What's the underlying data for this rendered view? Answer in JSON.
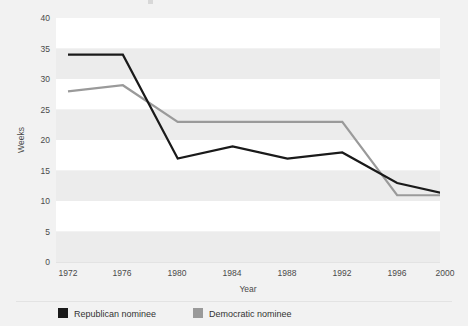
{
  "chart_data": {
    "type": "line",
    "title": "",
    "xlabel": "Year",
    "ylabel": "Weeks",
    "categories": [
      "1972",
      "1976",
      "1980",
      "1984",
      "1988",
      "1992",
      "1996",
      "2000"
    ],
    "x": [
      1972,
      1976,
      1980,
      1984,
      1988,
      1992,
      1996,
      2000
    ],
    "xlim": [
      1972,
      2000
    ],
    "ylim": [
      0,
      40
    ],
    "yticks": [
      "0",
      "5",
      "10",
      "15",
      "20",
      "25",
      "30",
      "35",
      "40"
    ],
    "ytick_values": [
      0,
      5,
      10,
      15,
      20,
      25,
      30,
      35,
      40
    ],
    "grid": "horizontal-banding",
    "legend_position": "bottom",
    "series": [
      {
        "name": "Republican nominee",
        "color": "#1a1a1a",
        "values": [
          34,
          34,
          17,
          19,
          17,
          18,
          13,
          11
        ]
      },
      {
        "name": "Democratic nominee",
        "color": "#9a9a9a",
        "values": [
          28,
          29,
          23,
          23,
          23,
          23,
          11,
          11
        ]
      }
    ]
  },
  "legend": {
    "items": [
      {
        "label": "Republican nominee",
        "swatch": "#1a1a1a"
      },
      {
        "label": "Democratic nominee",
        "swatch": "#9a9a9a"
      }
    ]
  },
  "colors": {
    "page_background": "#f2f2f2",
    "band_light": "#ffffff",
    "band_shade": "#ececec",
    "separator": "#e3e3e3",
    "republican": "#1a1a1a",
    "democratic": "#9a9a9a",
    "text": "#4a4a4a"
  }
}
